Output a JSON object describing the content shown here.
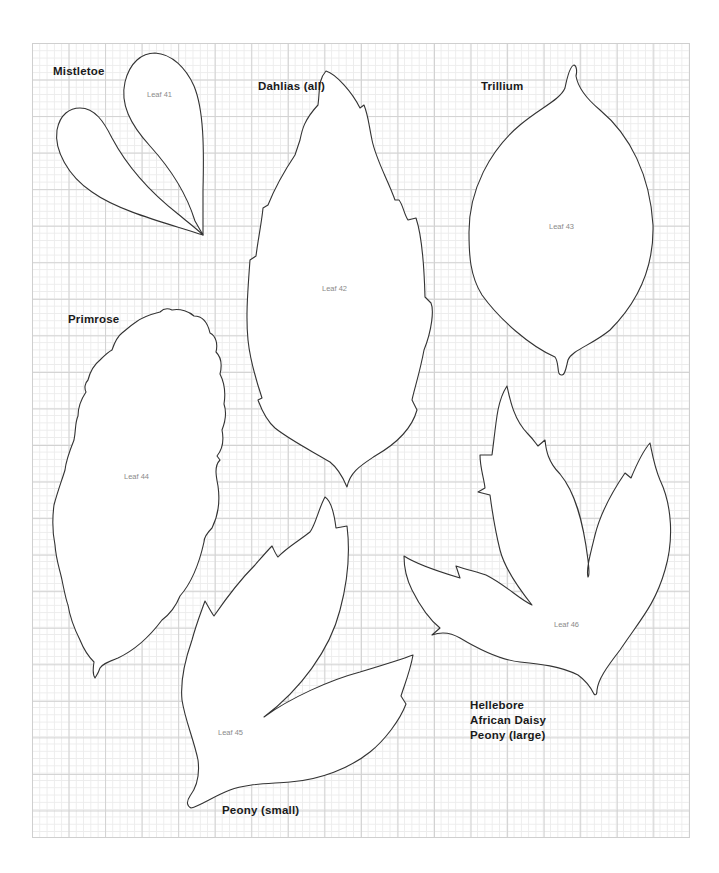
{
  "page": {
    "background": "#ffffff",
    "grid": {
      "minor_color": "#ececec",
      "major_color": "#d2d2d2",
      "outline_color": "#333333"
    }
  },
  "species_labels": {
    "mistletoe": "Mistletoe",
    "dahlias": "Dahlias (all)",
    "trillium": "Trillium",
    "primrose": "Primrose",
    "hellebore": "Hellebore",
    "african_daisy": "African Daisy",
    "peony_large": "Peony (large)",
    "peony_small": "Peony (small)"
  },
  "leaves": [
    {
      "id": "leaf-41",
      "label": "Leaf 41"
    },
    {
      "id": "leaf-42",
      "label": "Leaf 42"
    },
    {
      "id": "leaf-43",
      "label": "Leaf 43"
    },
    {
      "id": "leaf-44",
      "label": "Leaf 44"
    },
    {
      "id": "leaf-45",
      "label": "Leaf 45"
    },
    {
      "id": "leaf-46",
      "label": "Leaf 46"
    }
  ]
}
